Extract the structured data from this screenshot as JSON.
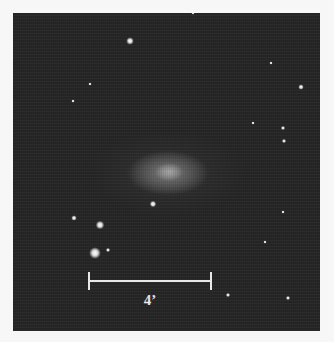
{
  "image": {
    "subject": "galaxy",
    "background_color": "#262626",
    "page_color": "#f7f7f7"
  },
  "scale_bar": {
    "label": "4’"
  },
  "stars": [
    {
      "x": 117,
      "y": 28,
      "r": 7
    },
    {
      "x": 87,
      "y": 212,
      "r": 8
    },
    {
      "x": 82,
      "y": 240,
      "r": 11
    },
    {
      "x": 61,
      "y": 205,
      "r": 5
    },
    {
      "x": 95,
      "y": 237,
      "r": 4
    },
    {
      "x": 140,
      "y": 191,
      "r": 6
    },
    {
      "x": 215,
      "y": 282,
      "r": 4
    },
    {
      "x": 275,
      "y": 285,
      "r": 4
    },
    {
      "x": 288,
      "y": 74,
      "r": 5
    },
    {
      "x": 270,
      "y": 115,
      "r": 4
    },
    {
      "x": 271,
      "y": 128,
      "r": 4
    },
    {
      "x": 258,
      "y": 50,
      "r": 3
    },
    {
      "x": 240,
      "y": 110,
      "r": 3
    },
    {
      "x": 270,
      "y": 199,
      "r": 3
    },
    {
      "x": 252,
      "y": 229,
      "r": 3
    },
    {
      "x": 60,
      "y": 88,
      "r": 3
    },
    {
      "x": 77,
      "y": 71,
      "r": 3
    },
    {
      "x": 180,
      "y": 0,
      "r": 3
    }
  ]
}
